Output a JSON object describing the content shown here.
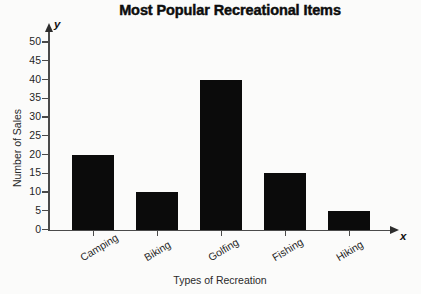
{
  "chart_data": {
    "type": "bar",
    "title": "Most Popular Recreational Items",
    "xlabel": "Types of Recreation",
    "ylabel": "Number of Sales",
    "categories": [
      "Camping",
      "Biking",
      "Golfing",
      "Fishing",
      "Hiking"
    ],
    "values": [
      20,
      10,
      40,
      15,
      5
    ],
    "ylim": [
      0,
      50
    ],
    "ytick_step": 5,
    "yticks": [
      0,
      5,
      10,
      15,
      20,
      25,
      30,
      35,
      40,
      45,
      50
    ],
    "ytick_labels": [
      "0",
      "5",
      "10",
      "15",
      "20",
      "25",
      "30",
      "35",
      "40",
      "45",
      "50"
    ],
    "grid": false,
    "legend": false,
    "axis_letters": {
      "x": "x",
      "y": "y"
    },
    "bar_color": "#0b0b0b",
    "axis_color": "#4a4a4a",
    "background": "#fbfbfa"
  }
}
